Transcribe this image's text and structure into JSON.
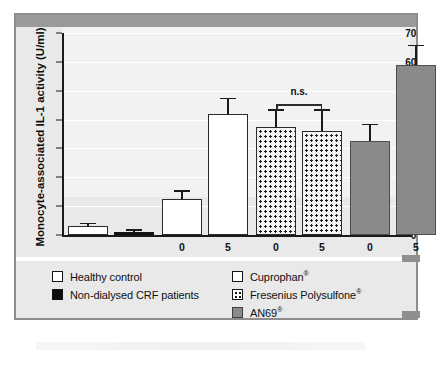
{
  "chart_data": {
    "type": "bar",
    "title": "",
    "xlabel": "Time (h)",
    "ylabel": "Monocyte-associated IL-1 activity (U/ml)",
    "ylim": [
      0,
      70
    ],
    "ytick_step": 10,
    "yticks": [
      "70",
      "60",
      "50",
      "40",
      "30",
      "20",
      "10",
      "0"
    ],
    "grid": true,
    "legend_position": "below-plot",
    "categories": [
      "Healthy control",
      "Non-dialysed CRF patients",
      "Cuprophan 0",
      "Cuprophan 5",
      "Fresenius Polysulfone 0",
      "Fresenius Polysulfone 5",
      "AN69 0",
      "AN69 5"
    ],
    "xtick_labels": [
      "",
      "",
      "0",
      "5",
      "0",
      "5",
      "0",
      "5"
    ],
    "values": [
      3,
      1,
      12.5,
      42,
      37.5,
      36,
      32.5,
      59
    ],
    "error_high": [
      4.2,
      2,
      15.5,
      47.5,
      43.5,
      43.5,
      38.5,
      66
    ],
    "series_fill": [
      "white",
      "black",
      "white",
      "white",
      "dotted",
      "dotted",
      "grey",
      "grey"
    ],
    "annotations": [
      {
        "text": "n.s.",
        "type": "significance-bracket",
        "spans": [
          "Fresenius Polysulfone 0",
          "Fresenius Polysulfone 5"
        ]
      }
    ]
  },
  "axes": {
    "y_title": "Monocyte-associated IL-1 activity (U/ml)",
    "x_title": "Time (h)"
  },
  "annotation": {
    "ns_label": "n.s."
  },
  "legend": {
    "left_column": [
      {
        "label": "Healthy control",
        "swatch": "white"
      },
      {
        "label": "Non-dialysed CRF patients",
        "swatch": "black"
      }
    ],
    "right_column": [
      {
        "label": "Cuprophan",
        "registered": "®",
        "swatch": "white"
      },
      {
        "label": "Fresenius Polysulfone",
        "registered": "®",
        "swatch": "dotted"
      },
      {
        "label": "AN69",
        "registered": "®",
        "swatch": "grey"
      }
    ]
  },
  "colors": {
    "bar_white": "#ffffff",
    "bar_black": "#111111",
    "bar_grey": "#8a8a8a",
    "panel_background": "#e9e9e9",
    "plot_background": "#f2f2f2",
    "axis": "#1a1a1a",
    "frame": "#8d8d8d",
    "top_band": "#9a9a9a"
  }
}
